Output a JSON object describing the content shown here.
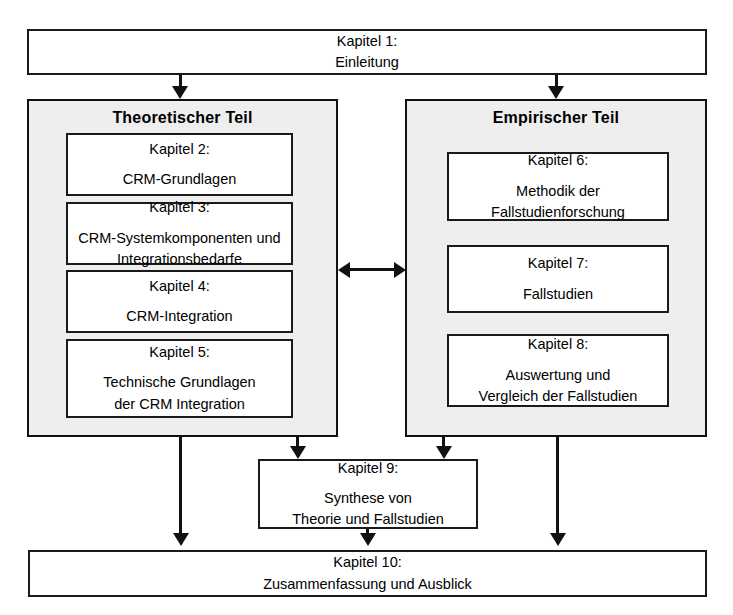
{
  "diagram": {
    "title_box": {
      "lines": [
        "Kapitel 1:",
        "Einleitung"
      ]
    },
    "left_group": {
      "title": "Theoretischer Teil",
      "boxes": [
        {
          "lines": [
            "Kapitel 2:",
            "CRM-Grundlagen"
          ]
        },
        {
          "lines": [
            "Kapitel 3:",
            "CRM-Systemkomponenten und",
            "Integrationsbedarfe"
          ]
        },
        {
          "lines": [
            "Kapitel 4:",
            "CRM-Integration"
          ]
        },
        {
          "lines": [
            "Kapitel 5:",
            "Technische Grundlagen",
            "der CRM Integration"
          ]
        }
      ]
    },
    "right_group": {
      "title": "Empirischer Teil",
      "boxes": [
        {
          "lines": [
            "Kapitel 6:",
            "Methodik der",
            "Fallstudienforschung"
          ]
        },
        {
          "lines": [
            "Kapitel 7:",
            "Fallstudien"
          ]
        },
        {
          "lines": [
            "Kapitel 8:",
            "Auswertung und",
            "Vergleich der Fallstudien"
          ]
        }
      ]
    },
    "synthesis_box": {
      "lines": [
        "Kapitel 9:",
        "Synthese von",
        "Theorie und Fallstudien"
      ]
    },
    "summary_box": {
      "lines": [
        "Kapitel 10:",
        "Zusammenfassung und Ausblick"
      ]
    },
    "colors": {
      "group_fill": "#eeeeee",
      "box_fill": "#ffffff",
      "stroke": "#111111",
      "text": "#000000"
    },
    "connectors": {
      "intro_to_left": "arrow-down",
      "intro_to_right": "arrow-down",
      "between_groups": "bidirectional-arrow",
      "left_to_synthesis": "arrow-down",
      "right_to_synthesis": "arrow-down",
      "left_to_summary": "arrow-down",
      "synthesis_to_summary": "arrow-down",
      "right_to_summary": "arrow-down"
    }
  }
}
